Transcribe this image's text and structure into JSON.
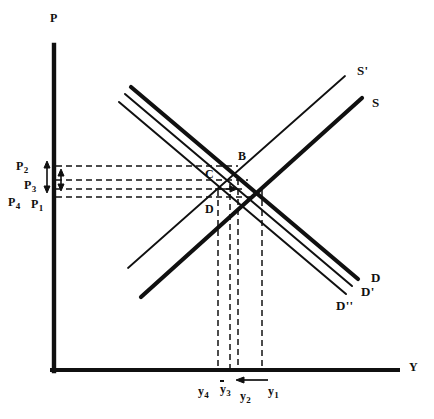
{
  "figure": {
    "background": "#ffffff",
    "ink": "#101010",
    "width": 434,
    "height": 419
  },
  "axes": {
    "y_axis_label": "P",
    "x_axis_label": "Y",
    "origin": {
      "x": 53,
      "y": 370
    },
    "y_axis_top": {
      "x": 53,
      "y": 45
    },
    "x_axis_right": {
      "x": 398,
      "y": 370
    }
  },
  "curves": [
    {
      "name": "supply-s-prime",
      "label": "S'",
      "weight": "thin",
      "label_pos": {
        "x": 357,
        "y": 64
      },
      "x1": 128,
      "y1": 268,
      "x2": 345,
      "y2": 76
    },
    {
      "name": "supply-s",
      "label": "S",
      "weight": "thick",
      "label_pos": {
        "x": 372,
        "y": 96
      },
      "x1": 141,
      "y1": 297,
      "x2": 362,
      "y2": 98
    },
    {
      "name": "demand-d",
      "label": "D",
      "weight": "thick",
      "label_pos": {
        "x": 371,
        "y": 271
      },
      "x1": 131,
      "y1": 87,
      "x2": 358,
      "y2": 279
    },
    {
      "name": "demand-d-prime",
      "label": "D'",
      "weight": "thin",
      "label_pos": {
        "x": 361,
        "y": 285
      },
      "x1": 125,
      "y1": 94,
      "x2": 352,
      "y2": 286
    },
    {
      "name": "demand-d-double-prime",
      "label": "D''",
      "weight": "thin",
      "label_pos": {
        "x": 338,
        "y": 299
      },
      "x1": 119,
      "y1": 102,
      "x2": 346,
      "y2": 294
    }
  ],
  "points": [
    {
      "name": "point-b",
      "label": "B",
      "x": 238,
      "y": 150
    },
    {
      "name": "point-c",
      "label": "C",
      "x": 205,
      "y": 168
    },
    {
      "name": "point-d",
      "label": "D",
      "x": 205,
      "y": 203
    }
  ],
  "price_levels": [
    {
      "name": "p2",
      "base": "P",
      "sub": "2",
      "y": 166,
      "label_x": 16,
      "label_y": 160
    },
    {
      "name": "p3",
      "base": "P",
      "sub": "3",
      "y": 180,
      "label_x": 24,
      "label_y": 179
    },
    {
      "name": "p4",
      "base": "P",
      "sub": "4",
      "y": 189,
      "label_x": 8,
      "label_y": 196
    },
    {
      "name": "p1",
      "base": "P",
      "sub": "1",
      "y": 197,
      "label_x": 31,
      "label_y": 198
    }
  ],
  "quantity_levels": [
    {
      "name": "y4",
      "base": "y",
      "sub": "4",
      "overbar": false,
      "arrow": false,
      "x": 218,
      "label_x": 198,
      "label_y": 385
    },
    {
      "name": "y3",
      "base": "y",
      "sub": "3",
      "overbar": true,
      "arrow": false,
      "x": 230,
      "label_x": 220,
      "label_y": 383
    },
    {
      "name": "y2",
      "base": "y",
      "sub": "2",
      "overbar": false,
      "arrow": true,
      "x": 238,
      "label_x": 240,
      "label_y": 390
    },
    {
      "name": "y1",
      "base": "y",
      "sub": "1",
      "overbar": false,
      "arrow": false,
      "x": 262,
      "label_x": 268,
      "label_y": 385
    }
  ],
  "annotations": {
    "price_gap_arrow": {
      "name": "price-gap-double-arrow",
      "x": 53,
      "y_top": 164,
      "y_bottom": 190
    },
    "quantity_shift_arrow": {
      "name": "quantity-shift-left-arrow",
      "x_from": 268,
      "x_to": 238,
      "y": 380
    }
  },
  "dashed_guides": {
    "horizontal_right_ends": [
      238,
      246,
      243,
      252
    ],
    "vertical_bottom": 372
  }
}
